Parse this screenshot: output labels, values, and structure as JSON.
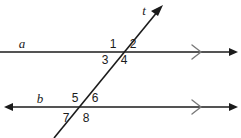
{
  "figure": {
    "stroke_color": "#1b1b1b",
    "background_color": "#ffffff",
    "line_width": 1.6,
    "lines": [
      {
        "id": "line-a",
        "label": "a",
        "kind": "horizontal",
        "label_x": 22,
        "label_y": 48,
        "y": 52,
        "x_start": 0,
        "x_end": 238,
        "arrow_left": false,
        "arrow_right": true,
        "tick_mark": ">",
        "tick_x": 196
      },
      {
        "id": "line-b",
        "label": "b",
        "kind": "horizontal",
        "label_x": 40,
        "label_y": 103,
        "y": 107,
        "x_start": 6,
        "x_end": 238,
        "arrow_left": true,
        "arrow_right": true,
        "tick_mark": ">",
        "tick_x": 196
      },
      {
        "id": "line-t",
        "label": "t",
        "kind": "transversal",
        "label_x": 144,
        "label_y": 15,
        "x_start": 54,
        "y_start": 138,
        "x_end": 163,
        "y_end": 5,
        "arrow_left": false,
        "arrow_right": true
      }
    ],
    "intersections": [
      {
        "id": "intersection-a-t",
        "x": 118,
        "y": 52
      },
      {
        "id": "intersection-b-t",
        "x": 80,
        "y": 107
      }
    ],
    "angles": [
      {
        "id": "angle-1",
        "label": "1",
        "x": 113,
        "y": 48,
        "at": "intersection-a-t",
        "position": "upper-left"
      },
      {
        "id": "angle-2",
        "label": "2",
        "x": 133,
        "y": 48,
        "at": "intersection-a-t",
        "position": "upper-right"
      },
      {
        "id": "angle-3",
        "label": "3",
        "x": 105,
        "y": 64,
        "at": "intersection-a-t",
        "position": "lower-left"
      },
      {
        "id": "angle-4",
        "label": "4",
        "x": 124,
        "y": 64,
        "at": "intersection-a-t",
        "position": "lower-right"
      },
      {
        "id": "angle-5",
        "label": "5",
        "x": 75,
        "y": 102,
        "at": "intersection-b-t",
        "position": "upper-left"
      },
      {
        "id": "angle-6",
        "label": "6",
        "x": 95,
        "y": 102,
        "at": "intersection-b-t",
        "position": "upper-right"
      },
      {
        "id": "angle-7",
        "label": "7",
        "x": 66,
        "y": 122,
        "at": "intersection-b-t",
        "position": "lower-left"
      },
      {
        "id": "angle-8",
        "label": "8",
        "x": 86,
        "y": 122,
        "at": "intersection-b-t",
        "position": "lower-right"
      }
    ]
  }
}
